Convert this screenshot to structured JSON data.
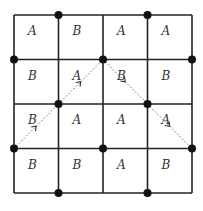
{
  "diagram": {
    "grid": {
      "rows": 4,
      "cols": 4,
      "x0": 14,
      "y0": 15,
      "cell": 44.5,
      "line_color": "#222222"
    },
    "cells": [
      [
        "A",
        "B",
        "A",
        "A"
      ],
      [
        "B",
        "A",
        "B",
        "B"
      ],
      [
        "B",
        "A",
        "A",
        "A"
      ],
      [
        "B",
        "B",
        "A",
        "B"
      ]
    ],
    "dots": [
      {
        "gx": 1,
        "gy": 0
      },
      {
        "gx": 3,
        "gy": 0
      },
      {
        "gx": 0,
        "gy": 1
      },
      {
        "gx": 2,
        "gy": 1
      },
      {
        "gx": 4,
        "gy": 1
      },
      {
        "gx": 1,
        "gy": 2
      },
      {
        "gx": 3,
        "gy": 2
      },
      {
        "gx": 0,
        "gy": 3
      },
      {
        "gx": 2,
        "gy": 3
      },
      {
        "gx": 4,
        "gy": 3
      },
      {
        "gx": 1,
        "gy": 4
      },
      {
        "gx": 3,
        "gy": 4
      }
    ],
    "paths": [
      {
        "from": {
          "gx": 0,
          "gy": 3
        },
        "to": {
          "gx": 2,
          "gy": 1
        },
        "arrows": [
          {
            "gx": 0.5,
            "gy": 2.5
          },
          {
            "gx": 1.5,
            "gy": 1.5
          }
        ]
      },
      {
        "from": {
          "gx": 2,
          "gy": 1
        },
        "to": {
          "gx": 4,
          "gy": 3
        },
        "arrows": [
          {
            "gx": 2.5,
            "gy": 1.5
          },
          {
            "gx": 3.5,
            "gy": 2.5
          }
        ]
      }
    ]
  }
}
